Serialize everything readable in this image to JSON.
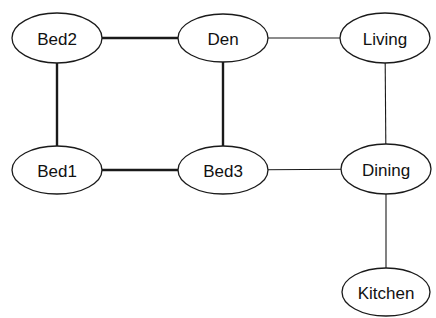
{
  "diagram": {
    "type": "undirected-graph",
    "nodes": [
      {
        "id": "bed2",
        "label": "Bed2",
        "cx": 57,
        "cy": 38,
        "rx": 45,
        "ry": 25
      },
      {
        "id": "den",
        "label": "Den",
        "cx": 223,
        "cy": 38,
        "rx": 45,
        "ry": 24
      },
      {
        "id": "living",
        "label": "Living",
        "cx": 385,
        "cy": 38,
        "rx": 45,
        "ry": 25
      },
      {
        "id": "bed1",
        "label": "Bed1",
        "cx": 57,
        "cy": 170,
        "rx": 45,
        "ry": 24
      },
      {
        "id": "bed3",
        "label": "Bed3",
        "cx": 223,
        "cy": 170,
        "rx": 45,
        "ry": 24
      },
      {
        "id": "dining",
        "label": "Dining",
        "cx": 386,
        "cy": 169,
        "rx": 45,
        "ry": 25
      },
      {
        "id": "kitchen",
        "label": "Kitchen",
        "cx": 386,
        "cy": 292,
        "rx": 44,
        "ry": 24
      }
    ],
    "edges": [
      {
        "from": "bed2",
        "to": "den",
        "weight": "thick"
      },
      {
        "from": "den",
        "to": "living",
        "weight": "thin"
      },
      {
        "from": "bed2",
        "to": "bed1",
        "weight": "thick"
      },
      {
        "from": "den",
        "to": "bed3",
        "weight": "thick"
      },
      {
        "from": "living",
        "to": "dining",
        "weight": "thin"
      },
      {
        "from": "bed1",
        "to": "bed3",
        "weight": "thick"
      },
      {
        "from": "bed3",
        "to": "dining",
        "weight": "thin"
      },
      {
        "from": "dining",
        "to": "kitchen",
        "weight": "thin"
      }
    ]
  }
}
